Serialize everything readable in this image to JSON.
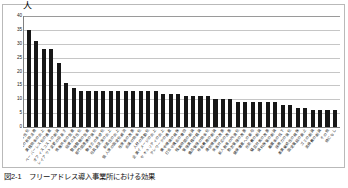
{
  "figure": {
    "unit_label": "人",
    "caption": "図2-1　フリーアドレス導入事業所における効果"
  },
  "chart_data": {
    "type": "bar",
    "title": "",
    "xlabel": "",
    "ylabel": "人",
    "ylim": [
      0,
      40
    ],
    "yticks": [
      0,
      5,
      10,
      15,
      20,
      25,
      30,
      35,
      40
    ],
    "grid": true,
    "legend": "none",
    "bar_color": "#171717",
    "categories": [
      "コミュニケーションの活性化",
      "スペースの有効活用",
      "業務効率の向上",
      "ペーパーレス化の推進",
      "オフィスコストの削減",
      "レイアウト変更の容易さ",
      "情報共有の促進",
      "組織の活性化",
      "整理整頓の促進",
      "部門間連携の強化",
      "働き方の多様化",
      "社員満足度の向上",
      "創造性の向上",
      "個人席の固定化解消",
      "在席率の改善",
      "会議の効率化",
      "人材の流動化",
      "企業イメージの向上",
      "セキュリティの向上",
      "テレワークの推進",
      "集中環境の確保",
      "打合せ機会の増加",
      "残業時間の削減",
      "管理業務の軽減",
      "備品管理の効率化",
      "移転費用の削減",
      "通信環境の改善",
      "来客対応の改善",
      "新人教育の円滑化",
      "勤怠管理の改善",
      "健康増進への寄与",
      "光熱費の削減",
      "騒音対策の改善",
      "資料保管の削減",
      "離職率の低下",
      "採用力の強化",
      "事業継続性の確保",
      "固定電話の廃止",
      "ゴミの削減",
      "清掃費の削減",
      "その他",
      "特になし"
    ],
    "values": [
      35,
      31,
      28,
      28,
      23,
      16,
      14,
      13,
      13,
      13,
      13,
      13,
      13,
      13,
      13,
      13,
      13,
      13,
      12,
      12,
      12,
      11,
      11,
      11,
      11,
      10,
      10,
      10,
      9,
      9,
      9,
      9,
      9,
      9,
      8,
      8,
      7,
      7,
      6,
      6,
      6,
      6
    ]
  }
}
